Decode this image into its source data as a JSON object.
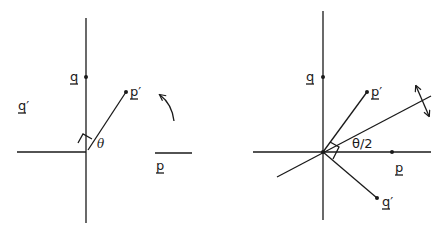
{
  "left_panel": {
    "labels": {
      "q": "q",
      "q_prime": "q′",
      "p_prime": "p′",
      "p": "p",
      "theta": "θ"
    },
    "description": "Rotation by angle θ: p rotates to p′, q rotates to q′"
  },
  "right_panel": {
    "labels": {
      "q": "q",
      "p_prime": "p′",
      "p": "p",
      "q_prime": "q′",
      "half_theta": "θ/2"
    },
    "description": "Reflection across a line at angle θ/2: p reflects to p′, q reflects to q′"
  },
  "colors": {
    "ink": "#1a1a1a",
    "background": "#ffffff"
  }
}
